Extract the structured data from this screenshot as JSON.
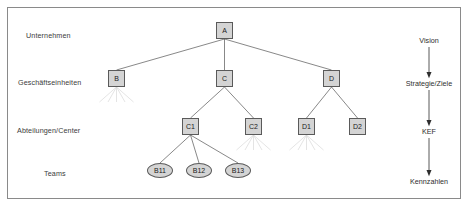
{
  "diagram": {
    "frame_border_color": "#8a8a8a",
    "node_fill_color": "#d4d4d4",
    "node_border_color": "#5a5a5a",
    "connector_color": "#555555",
    "ghost_connector_color": "#d8d8d8"
  },
  "row_labels": [
    {
      "id": "unternehmen",
      "label": "Unternehmen",
      "x": 26,
      "y": 31
    },
    {
      "id": "geschaeftseinheiten",
      "label": "Geschäftseinheiten",
      "x": 18,
      "y": 78
    },
    {
      "id": "abteilungen",
      "label": "Abteilungen/Center",
      "x": 17,
      "y": 126
    },
    {
      "id": "teams",
      "label": "Teams",
      "x": 44,
      "y": 169
    }
  ],
  "nodes": [
    {
      "id": "A",
      "label": "A",
      "shape": "box",
      "x": 216,
      "y": 22,
      "level": "unternehmen"
    },
    {
      "id": "B",
      "label": "B",
      "shape": "box",
      "x": 108,
      "y": 70,
      "level": "geschaeftseinheiten"
    },
    {
      "id": "C",
      "label": "C",
      "shape": "box",
      "x": 216,
      "y": 70,
      "level": "geschaeftseinheiten"
    },
    {
      "id": "D",
      "label": "D",
      "shape": "box",
      "x": 323,
      "y": 70,
      "level": "geschaeftseinheiten"
    },
    {
      "id": "C1",
      "label": "C1",
      "shape": "box",
      "x": 182,
      "y": 118,
      "level": "abteilungen"
    },
    {
      "id": "C2",
      "label": "C2",
      "shape": "box",
      "x": 245,
      "y": 118,
      "level": "abteilungen"
    },
    {
      "id": "D1",
      "label": "D1",
      "shape": "box",
      "x": 298,
      "y": 118,
      "level": "abteilungen"
    },
    {
      "id": "D2",
      "label": "D2",
      "shape": "box",
      "x": 349,
      "y": 118,
      "level": "abteilungen"
    },
    {
      "id": "B11",
      "label": "B11",
      "shape": "ellipse",
      "x": 147,
      "y": 163,
      "level": "teams"
    },
    {
      "id": "B12",
      "label": "B12",
      "shape": "ellipse",
      "x": 186,
      "y": 163,
      "level": "teams"
    },
    {
      "id": "B13",
      "label": "B13",
      "shape": "ellipse",
      "x": 225,
      "y": 163,
      "level": "teams"
    }
  ],
  "edges": [
    {
      "from": "A",
      "to": "B"
    },
    {
      "from": "A",
      "to": "C"
    },
    {
      "from": "A",
      "to": "D"
    },
    {
      "from": "C",
      "to": "C1"
    },
    {
      "from": "C",
      "to": "C2"
    },
    {
      "from": "D",
      "to": "D1"
    },
    {
      "from": "D",
      "to": "D2"
    },
    {
      "from": "C1",
      "to": "B11"
    },
    {
      "from": "C1",
      "to": "B12"
    },
    {
      "from": "C1",
      "to": "B13"
    }
  ],
  "collapsed_nodes": [
    "B",
    "C2",
    "D1"
  ],
  "flow": {
    "x": 429,
    "steps": [
      {
        "id": "vision",
        "label": "Vision",
        "y": 36
      },
      {
        "id": "strategie",
        "label": "Strategie/Ziele",
        "y": 79
      },
      {
        "id": "kef",
        "label": "KEF",
        "y": 127
      },
      {
        "id": "kennzahlen",
        "label": "Kennzahlen",
        "y": 177
      }
    ]
  },
  "caption": {
    "text": ""
  }
}
